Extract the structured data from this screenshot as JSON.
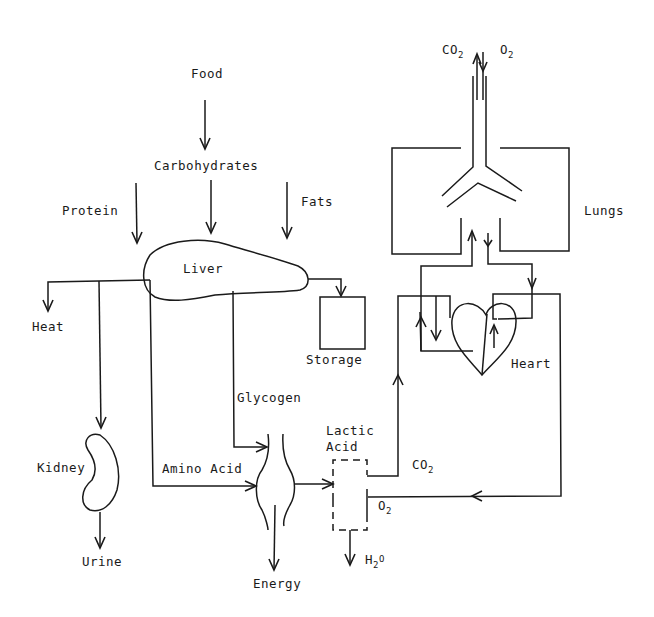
{
  "diagram": {
    "title": "",
    "nodes": {
      "food": "Food",
      "carbohydrates": "Carbohydrates",
      "protein": "Protein",
      "fats": "Fats",
      "liver": "Liver",
      "heat": "Heat",
      "storage": "Storage",
      "glycogen": "Glycogen",
      "kidney": "Kidney",
      "urine": "Urine",
      "amino_acid": "Amino Acid",
      "energy": "Energy",
      "lactic_acid_line1": "Lactic",
      "lactic_acid_line2": "Acid",
      "water_main": "H",
      "water_sub": "2",
      "water_tail": "O",
      "co2_muscle_main": "CO",
      "co2_muscle_sub": "2",
      "o2_muscle_main": "O",
      "o2_muscle_sub": "2",
      "co2_lungs_main": "CO",
      "co2_lungs_sub": "2",
      "o2_lungs_main": "O",
      "o2_lungs_sub": "2",
      "lungs": "Lungs",
      "heart": "Heart"
    },
    "edges": [
      {
        "from": "Food",
        "to": "Carbohydrates"
      },
      {
        "from": "Carbohydrates",
        "to": "Liver"
      },
      {
        "from": "Protein",
        "to": "Liver"
      },
      {
        "from": "Fats",
        "to": "Liver"
      },
      {
        "from": "Liver",
        "to": "Heat"
      },
      {
        "from": "Liver",
        "to": "Kidney"
      },
      {
        "from": "Kidney",
        "to": "Urine"
      },
      {
        "from": "Liver",
        "to": "Storage"
      },
      {
        "from": "Liver",
        "to": "Muscle",
        "label": "Glycogen"
      },
      {
        "from": "Liver",
        "to": "Muscle",
        "label": "Amino Acid"
      },
      {
        "from": "Muscle",
        "to": "Energy"
      },
      {
        "from": "Muscle",
        "to": "Lactic Acid"
      },
      {
        "from": "Lactic Acid",
        "to": "H2O"
      },
      {
        "from": "Lactic Acid",
        "to": "Heart",
        "label": "CO2"
      },
      {
        "from": "Heart",
        "to": "Lungs"
      },
      {
        "from": "Lungs",
        "to": "Heart"
      },
      {
        "from": "Heart",
        "to": "Lactic Acid",
        "label": "O2"
      },
      {
        "from": "Lungs",
        "to": "Atmosphere",
        "label": "CO2"
      },
      {
        "from": "Atmosphere",
        "to": "Lungs",
        "label": "O2"
      }
    ]
  }
}
